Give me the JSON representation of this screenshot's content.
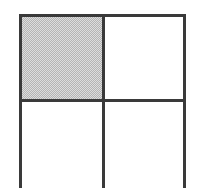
{
  "figure": {
    "type": "grid-diagram",
    "title": "",
    "canvas": {
      "width_px": 198,
      "height_px": 188,
      "background_color": "#ffffff"
    },
    "style": {
      "line_color": "#3a3a3a",
      "line_width_px": 3,
      "shaded_fill_color": "#b4b4b4",
      "shaded_fill_pattern": "checkerboard-dither",
      "empty_fill_color": "#ffffff"
    },
    "geometry": {
      "rows": 2,
      "columns": 2,
      "left_edge_x": 19,
      "middle_vertical_x": 102,
      "right_edge_x": 186,
      "top_edge_y": 14,
      "middle_horizontal_y": 99,
      "bottom_edge": "cropped"
    },
    "cells": [
      {
        "id": "cell-r0-c0",
        "row": 0,
        "column": 0,
        "state": "shaded",
        "label": ""
      },
      {
        "id": "cell-r0-c1",
        "row": 0,
        "column": 1,
        "state": "empty",
        "label": ""
      },
      {
        "id": "cell-r1-c0",
        "row": 1,
        "column": 0,
        "state": "empty",
        "label": ""
      },
      {
        "id": "cell-r1-c1",
        "row": 1,
        "column": 1,
        "state": "empty",
        "label": ""
      }
    ],
    "lines": [
      {
        "id": "line-left",
        "orientation": "vertical",
        "name": "left-frame-line"
      },
      {
        "id": "line-mid-v",
        "orientation": "vertical",
        "name": "middle-vertical-divider"
      },
      {
        "id": "line-right",
        "orientation": "vertical",
        "name": "right-frame-line"
      },
      {
        "id": "line-top",
        "orientation": "horizontal",
        "name": "top-frame-line"
      },
      {
        "id": "line-mid-h",
        "orientation": "horizontal",
        "name": "middle-horizontal-divider"
      }
    ]
  }
}
